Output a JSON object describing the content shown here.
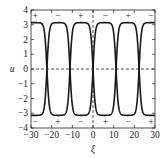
{
  "chart_data": {
    "type": "line",
    "title": "",
    "xlabel": "ξ",
    "ylabel": "u",
    "xlim": [
      -30,
      30
    ],
    "ylim": [
      -4,
      4
    ],
    "xticks": [
      "-30",
      "-20",
      "-10",
      "0",
      "10",
      "20",
      "30"
    ],
    "yticks": [
      "4",
      "3",
      "2",
      "1",
      "0",
      "-1",
      "-2",
      "-3",
      "-4"
    ],
    "grid": false,
    "reference_lines": {
      "horizontal": 0,
      "vertical": 0,
      "style": "dashed"
    },
    "series": [
      {
        "name": "solution A",
        "description": "kink-antikink chain alternating between u=+π and u=-π, transitions near ξ = -22, -11, 0, 11, 22",
        "plateaus": [
          3.14,
          -3.14,
          3.14,
          -3.14,
          3.14,
          -3.14
        ]
      },
      {
        "name": "solution B",
        "description": "mirror of solution A",
        "plateaus": [
          -3.14,
          3.14,
          -3.14,
          3.14,
          -3.14,
          3.14
        ]
      }
    ],
    "annotations": {
      "top_signs": [
        {
          "x": -28,
          "label": "+"
        },
        {
          "x": -17,
          "label": "−"
        },
        {
          "x": -6,
          "label": "+"
        },
        {
          "x": 6,
          "label": "−"
        },
        {
          "x": 17,
          "label": "+"
        },
        {
          "x": 28,
          "label": "−"
        }
      ],
      "bottom_signs": [
        {
          "x": -28,
          "label": "−"
        },
        {
          "x": -17,
          "label": "+"
        },
        {
          "x": -6,
          "label": "−"
        },
        {
          "x": 6,
          "label": "+"
        },
        {
          "x": 17,
          "label": "−"
        },
        {
          "x": 28,
          "label": "+"
        }
      ]
    }
  }
}
